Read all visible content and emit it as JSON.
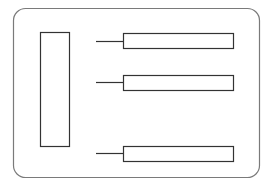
{
  "diagram": {
    "width": 275,
    "height": 186,
    "colors": {
      "background": "#ffffff",
      "frame_stroke": "#7a7a7a",
      "shape_stroke": "#333333",
      "shape_fill": "#ffffff"
    },
    "frame": {
      "x": 13,
      "y": 8,
      "width": 246,
      "height": 169,
      "radius": 12
    },
    "left_block": {
      "x": 40,
      "y": 32,
      "width": 29,
      "height": 114
    },
    "bars": [
      {
        "x": 123,
        "y": 33,
        "width": 110,
        "height": 15,
        "connector": {
          "x1": 96,
          "x2": 123,
          "y": 41
        }
      },
      {
        "x": 123,
        "y": 75,
        "width": 110,
        "height": 15,
        "connector": {
          "x1": 96,
          "x2": 123,
          "y": 82
        }
      },
      {
        "x": 123,
        "y": 146,
        "width": 110,
        "height": 15,
        "connector": {
          "x1": 96,
          "x2": 123,
          "y": 153
        }
      }
    ]
  }
}
